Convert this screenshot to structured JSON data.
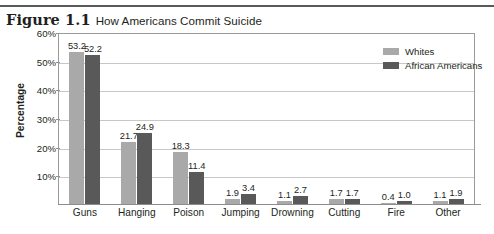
{
  "figure": {
    "label": "Figure 1.1",
    "title": "How Americans Commit Suicide"
  },
  "legend": {
    "items": [
      {
        "label": "Whites",
        "color": "#a9a9a9"
      },
      {
        "label": "African Americans",
        "color": "#595959"
      }
    ]
  },
  "axis": {
    "y_title": "Percentage",
    "y_ticks": [
      "60%",
      "50%",
      "40%",
      "30%",
      "20%",
      "10%"
    ]
  },
  "chart_data": {
    "type": "bar",
    "title": "How Americans Commit Suicide",
    "xlabel": "",
    "ylabel": "Percentage",
    "ylim": [
      0,
      60
    ],
    "grid": true,
    "legend_position": "top-right",
    "categories": [
      "Guns",
      "Hanging",
      "Poison",
      "Jumping",
      "Drowning",
      "Cutting",
      "Fire",
      "Other"
    ],
    "series": [
      {
        "name": "Whites",
        "color": "#a9a9a9",
        "values": [
          53.2,
          21.7,
          18.3,
          1.9,
          1.1,
          1.7,
          0.4,
          1.1
        ]
      },
      {
        "name": "African Americans",
        "color": "#595959",
        "values": [
          52.2,
          24.9,
          11.4,
          3.4,
          2.7,
          1.7,
          1.0,
          1.9
        ]
      }
    ]
  }
}
